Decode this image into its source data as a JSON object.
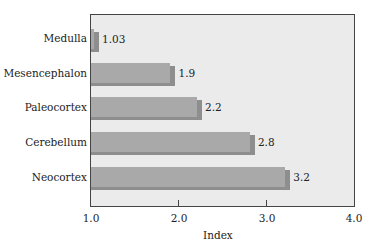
{
  "chart_data": {
    "type": "bar",
    "orientation": "horizontal",
    "title": "",
    "xlabel": "Index",
    "ylabel": "",
    "xlim": [
      1.0,
      4.0
    ],
    "xticks": [
      "1.0",
      "2.0",
      "3.0",
      "4.0"
    ],
    "grid": false,
    "legend": null,
    "categories": [
      "Medulla",
      "Mesencephalon",
      "Paleocortex",
      "Cerebellum",
      "Neocortex"
    ],
    "values": [
      1.03,
      1.9,
      2.2,
      2.8,
      3.2
    ],
    "value_labels": [
      "1.03",
      "1.9",
      "2.2",
      "2.8",
      "3.2"
    ],
    "colors": {
      "bar": "#a9a9a9",
      "bar_shadow": "#8e8e8e",
      "plot_bg": "#ebebeb"
    }
  }
}
